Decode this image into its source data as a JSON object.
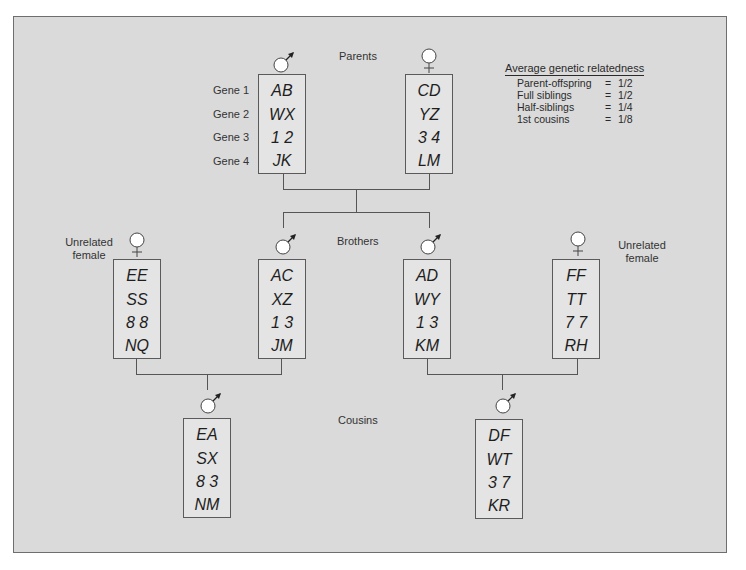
{
  "diagram": {
    "generation_labels": {
      "parents": "Parents",
      "brothers": "Brothers",
      "cousins": "Cousins"
    },
    "gene_labels": [
      "Gene 1",
      "Gene 2",
      "Gene 3",
      "Gene 4"
    ],
    "unrelated_label_left": [
      "Unrelated",
      "female"
    ],
    "unrelated_label_right": [
      "Unrelated",
      "female"
    ],
    "individuals": {
      "father": {
        "sex": "male",
        "alleles": [
          "AB",
          "WX",
          "1 2",
          "JK"
        ]
      },
      "mother": {
        "sex": "female",
        "alleles": [
          "CD",
          "YZ",
          "3 4",
          "LM"
        ]
      },
      "unrelated_female_left": {
        "sex": "female",
        "alleles": [
          "EE",
          "SS",
          "8 8",
          "NQ"
        ]
      },
      "brother_left": {
        "sex": "male",
        "alleles": [
          "AC",
          "XZ",
          "1 3",
          "JM"
        ]
      },
      "brother_right": {
        "sex": "male",
        "alleles": [
          "AD",
          "WY",
          "1 3",
          "KM"
        ]
      },
      "unrelated_female_right": {
        "sex": "female",
        "alleles": [
          "FF",
          "TT",
          "7 7",
          "RH"
        ]
      },
      "cousin_left": {
        "sex": "male",
        "alleles": [
          "EA",
          "SX",
          "8 3",
          "NM"
        ]
      },
      "cousin_right": {
        "sex": "male",
        "alleles": [
          "DF",
          "WT",
          "3 7",
          "KR"
        ]
      }
    },
    "legend": {
      "title": "Average genetic relatedness",
      "rows": [
        {
          "relation": "Parent-offspring",
          "eq": "=",
          "value": "1/2"
        },
        {
          "relation": "Full siblings",
          "eq": "=",
          "value": "1/2"
        },
        {
          "relation": "Half-siblings",
          "eq": "=",
          "value": "1/4"
        },
        {
          "relation": "1st cousins",
          "eq": "=",
          "value": "1/8"
        }
      ]
    },
    "colors": {
      "background": "#dadada",
      "box_fill": "#e4e4e4",
      "line": "#555555",
      "text": "#1e1e1e"
    }
  }
}
